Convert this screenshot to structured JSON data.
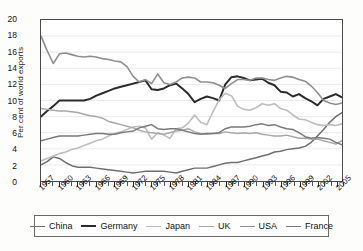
{
  "chart_data": {
    "type": "line",
    "title": "",
    "xlabel": "",
    "ylabel": "Per cent of world exports",
    "ylim": [
      0,
      20
    ],
    "ytick_step": 2,
    "yticks": [
      "20",
      "18",
      "16",
      "14",
      "12",
      "10",
      "8",
      "6",
      "4",
      "2",
      "0"
    ],
    "xlim": [
      1957,
      2006
    ],
    "xticks": [
      "1957",
      "1960",
      "1963",
      "1966",
      "1969",
      "1972",
      "1975",
      "1978",
      "1981",
      "1984",
      "1987",
      "1990",
      "1993",
      "1996",
      "1999",
      "2002",
      "2005"
    ],
    "grid": true,
    "legend_position": "bottom",
    "x": [
      1957,
      1958,
      1959,
      1960,
      1961,
      1962,
      1963,
      1964,
      1965,
      1966,
      1967,
      1968,
      1969,
      1970,
      1971,
      1972,
      1973,
      1974,
      1975,
      1976,
      1977,
      1978,
      1979,
      1980,
      1981,
      1982,
      1983,
      1984,
      1985,
      1986,
      1987,
      1988,
      1989,
      1990,
      1991,
      1992,
      1993,
      1994,
      1995,
      1996,
      1997,
      1998,
      1999,
      2000,
      2001,
      2002,
      2003,
      2004,
      2005,
      2006
    ],
    "series": [
      {
        "name": "China",
        "color": "#6f6f6f",
        "width": 1.5,
        "values": [
          2.0,
          2.4,
          3.0,
          2.8,
          2.3,
          1.9,
          1.7,
          1.7,
          1.7,
          1.6,
          1.5,
          1.4,
          1.3,
          1.2,
          1.1,
          1.0,
          1.1,
          1.2,
          1.2,
          1.2,
          1.2,
          1.1,
          1.0,
          1.2,
          1.4,
          1.6,
          1.6,
          1.6,
          1.8,
          2.0,
          2.2,
          2.3,
          2.3,
          2.5,
          2.7,
          2.9,
          3.1,
          3.3,
          3.6,
          3.7,
          3.9,
          4.0,
          4.1,
          4.3,
          4.8,
          5.6,
          6.4,
          7.3,
          8.0,
          8.5
        ]
      },
      {
        "name": "Germany",
        "color": "#2b2b2b",
        "width": 2.0,
        "values": [
          8.0,
          8.7,
          9.3,
          10.0,
          10.0,
          10.0,
          10.0,
          10.0,
          10.2,
          10.6,
          10.9,
          11.2,
          11.5,
          11.7,
          11.9,
          12.1,
          12.3,
          12.5,
          11.4,
          11.3,
          11.5,
          11.9,
          12.1,
          11.5,
          10.8,
          9.8,
          10.2,
          10.5,
          10.3,
          10.0,
          12.0,
          12.9,
          13.0,
          12.8,
          12.5,
          12.6,
          12.7,
          12.2,
          11.9,
          11.1,
          11.0,
          10.5,
          10.8,
          10.3,
          9.9,
          9.4,
          10.2,
          10.5,
          10.8,
          10.4
        ]
      },
      {
        "name": "Japan",
        "color": "#bdbdbd",
        "width": 1.6,
        "values": [
          2.5,
          2.8,
          3.1,
          3.4,
          3.6,
          3.9,
          4.1,
          4.4,
          4.7,
          5.0,
          5.2,
          5.6,
          5.9,
          6.1,
          6.4,
          6.7,
          6.8,
          6.6,
          5.2,
          6.0,
          5.7,
          5.3,
          6.5,
          6.6,
          7.2,
          8.2,
          7.3,
          7.0,
          8.6,
          10.1,
          10.9,
          10.6,
          9.3,
          8.9,
          8.8,
          9.1,
          9.6,
          9.4,
          9.6,
          9.0,
          8.8,
          8.2,
          7.7,
          7.6,
          7.3,
          7.0,
          6.9,
          7.0,
          6.9,
          7.1
        ]
      },
      {
        "name": "UK",
        "color": "#a8a8a8",
        "width": 1.5,
        "values": [
          9.0,
          8.9,
          8.8,
          8.7,
          8.7,
          8.6,
          8.5,
          8.3,
          8.1,
          8.0,
          7.8,
          7.4,
          7.2,
          7.0,
          6.8,
          6.6,
          6.3,
          6.1,
          6.0,
          5.9,
          5.8,
          6.0,
          6.2,
          6.3,
          6.5,
          6.1,
          5.9,
          5.8,
          5.9,
          5.9,
          6.1,
          6.0,
          5.9,
          6.0,
          5.9,
          6.0,
          5.8,
          5.7,
          5.6,
          5.6,
          5.7,
          5.5,
          5.3,
          5.3,
          5.2,
          5.2,
          5.0,
          4.8,
          4.6,
          5.0
        ]
      },
      {
        "name": "USA",
        "color": "#8f8f8f",
        "width": 1.6,
        "values": [
          18.0,
          16.2,
          14.6,
          15.8,
          15.9,
          15.7,
          15.5,
          15.4,
          15.5,
          15.4,
          15.2,
          15.1,
          14.9,
          14.8,
          14.2,
          13.0,
          12.3,
          12.6,
          12.1,
          13.3,
          12.2,
          12.0,
          12.3,
          12.8,
          12.9,
          12.8,
          12.3,
          12.3,
          12.2,
          11.9,
          11.5,
          12.1,
          12.6,
          12.6,
          12.5,
          12.8,
          12.8,
          12.6,
          12.5,
          12.8,
          13.0,
          12.9,
          12.6,
          12.4,
          11.8,
          11.0,
          10.0,
          9.7,
          9.5,
          9.7
        ]
      },
      {
        "name": "France",
        "color": "#7a7a7a",
        "width": 1.5,
        "values": [
          5.0,
          5.2,
          5.4,
          5.6,
          5.6,
          5.6,
          5.6,
          5.7,
          5.8,
          5.9,
          5.9,
          5.8,
          5.8,
          6.0,
          6.1,
          6.2,
          6.6,
          6.8,
          7.0,
          6.5,
          6.4,
          6.5,
          6.5,
          6.3,
          6.1,
          5.9,
          5.8,
          5.9,
          5.9,
          6.0,
          6.5,
          6.7,
          6.7,
          6.7,
          6.8,
          7.0,
          7.1,
          6.9,
          7.0,
          6.7,
          6.5,
          6.4,
          6.0,
          5.5,
          5.3,
          5.4,
          5.3,
          5.2,
          4.8,
          4.5
        ]
      }
    ]
  },
  "legend": {
    "items": [
      {
        "label": "China"
      },
      {
        "label": "Germany"
      },
      {
        "label": "Japan"
      },
      {
        "label": "UK"
      },
      {
        "label": "USA"
      },
      {
        "label": "France"
      }
    ]
  }
}
